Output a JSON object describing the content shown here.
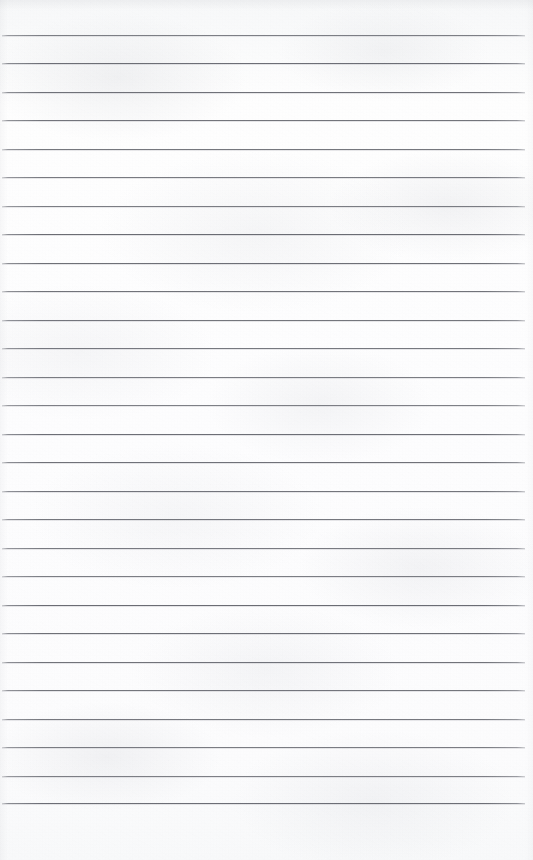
{
  "document": {
    "type": "scanned-page",
    "subject": "blank lined notebook paper",
    "orientation": "portrait",
    "page_width_px": 533,
    "page_height_px": 860,
    "content_text": "",
    "handwriting_present": "no",
    "printed_text_present": "no"
  },
  "paper": {
    "background_color": "#fdfdfd",
    "tint_color": "#f7f8f9",
    "texture": "mottled scan grain",
    "edge_shading": "faint darkening along top and left edges"
  },
  "ruling": {
    "style": "wide ruled horizontal lines",
    "line_color": "#60626a",
    "line_color_faded_ends": "#6e7078",
    "line_thickness_px": 1,
    "line_count": 28,
    "first_line_y_px": 35,
    "last_line_y_px": 803,
    "line_spacing_px": 28.5,
    "line_left_x_px": 2,
    "line_right_x_px": 525,
    "line_y_positions": [
      35,
      63,
      92,
      120,
      149,
      177,
      206,
      234,
      263,
      291,
      320,
      348,
      377,
      405,
      434,
      462,
      491,
      519,
      548,
      576,
      605,
      633,
      662,
      690,
      719,
      747,
      776,
      803
    ],
    "vertical_margin_rule": "none",
    "holes_or_binding": "none"
  },
  "margins": {
    "top_margin_px": 35,
    "bottom_margin_px": 57,
    "left_margin_px": 2,
    "right_margin_px": 8,
    "top_margin_label": "",
    "bottom_margin_label": ""
  }
}
